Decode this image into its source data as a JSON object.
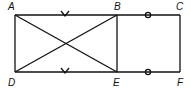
{
  "diagram": {
    "points": {
      "A": {
        "label": "A",
        "x": 15,
        "y": 15
      },
      "B": {
        "label": "B",
        "x": 117,
        "y": 15
      },
      "C": {
        "label": "C",
        "x": 180,
        "y": 15
      },
      "D": {
        "label": "D",
        "x": 15,
        "y": 72
      },
      "E": {
        "label": "E",
        "x": 117,
        "y": 72
      },
      "F": {
        "label": "F",
        "x": 180,
        "y": 72
      }
    },
    "segments": [
      "AB",
      "BC",
      "CF",
      "FE",
      "ED",
      "DA",
      "BE",
      "AE",
      "BD"
    ],
    "marks": [
      {
        "segment": "AB",
        "type": "v-tick"
      },
      {
        "segment": "DE",
        "type": "v-tick"
      },
      {
        "segment": "BC",
        "type": "circle"
      },
      {
        "segment": "EF",
        "type": "circle"
      }
    ],
    "stroke_color": "#111111"
  }
}
